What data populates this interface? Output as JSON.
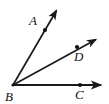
{
  "figure": {
    "kind": "geometry-angle-diagram",
    "background_color": "#ffffff",
    "stroke_color": "#1a1a1a",
    "width": 109,
    "height": 104
  },
  "labels": {
    "a": "A",
    "b": "B",
    "c": "C",
    "d": "D"
  },
  "vertex": {
    "name": "B",
    "x": 13,
    "y": 85
  },
  "rays": [
    {
      "name": "ray-BA",
      "from": "B",
      "through_point": "A",
      "x1": 13,
      "y1": 85,
      "x2": 58,
      "y2": 8,
      "dot_x": 45,
      "dot_y": 30,
      "arrowhead": true
    },
    {
      "name": "ray-BD",
      "from": "B",
      "through_point": "D",
      "x1": 13,
      "y1": 85,
      "x2": 99,
      "y2": 38,
      "dot_x": 77,
      "dot_y": 47,
      "arrowhead": true
    },
    {
      "name": "ray-BC",
      "from": "B",
      "through_point": "C",
      "x1": 13,
      "y1": 85,
      "x2": 105,
      "y2": 85,
      "dot_x": 80,
      "dot_y": 85,
      "arrowhead": true
    }
  ]
}
